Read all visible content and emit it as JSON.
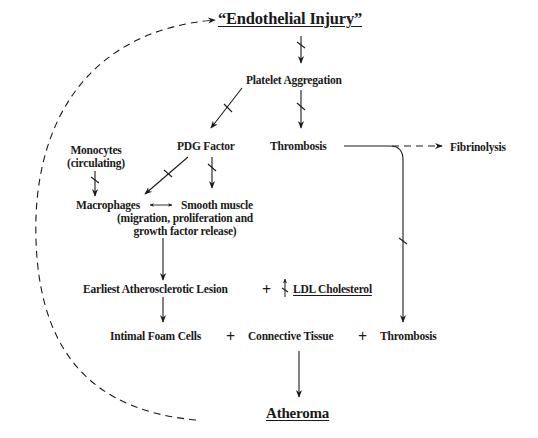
{
  "diagram": {
    "title": "“Endothelial Injury”",
    "nodes": {
      "endothelial_injury": "“Endothelial Injury”",
      "platelet_aggregation": "Platelet Aggregation",
      "pdg_factor": "PDG Factor",
      "thrombosis_top": "Thrombosis",
      "fibrinolysis": "Fibrinolysis",
      "monocytes_line1": "Monocytes",
      "monocytes_line2": "(circulating)",
      "macrophages": "Macrophages",
      "smooth_muscle": "Smooth muscle",
      "smc_detail_line1": "(migration, proliferation and",
      "smc_detail_line2": "growth factor release)",
      "earliest_lesion": "Earliest Atherosclerotic Lesion",
      "ldl_cholesterol": "LDL Cholesterol",
      "ldl_modifier_icon": "increase-arrow-icon",
      "intimal_foam_cells": "Intimal Foam Cells",
      "connective_tissue": "Connective Tissue",
      "thrombosis_bottom": "Thrombosis",
      "atheroma": "Atheroma"
    },
    "operators": {
      "plus1": "+",
      "plus2": "+",
      "plus3": "+"
    },
    "edges": [
      {
        "from": "Endothelial Injury",
        "to": "Platelet Aggregation",
        "style": "solid",
        "inhibited_mark": true
      },
      {
        "from": "Platelet Aggregation",
        "to": "PDG Factor",
        "style": "solid",
        "inhibited_mark": true
      },
      {
        "from": "Platelet Aggregation",
        "to": "Thrombosis",
        "style": "solid",
        "inhibited_mark": true
      },
      {
        "from": "Thrombosis",
        "to": "Fibrinolysis",
        "style": "dashed"
      },
      {
        "from": "Thrombosis",
        "to": "Thrombosis (bottom)",
        "style": "solid",
        "inhibited_mark": true
      },
      {
        "from": "Monocytes",
        "to": "Macrophages",
        "style": "solid",
        "inhibited_mark": true
      },
      {
        "from": "PDG Factor",
        "to": "Macrophages",
        "style": "solid",
        "inhibited_mark": true
      },
      {
        "from": "PDG Factor",
        "to": "Smooth muscle",
        "style": "solid",
        "inhibited_mark": true
      },
      {
        "from": "Macrophages",
        "to": "Smooth muscle",
        "style": "bidirectional"
      },
      {
        "from": "Macrophages/Smooth muscle",
        "to": "Earliest Atherosclerotic Lesion",
        "style": "solid"
      },
      {
        "from": "Earliest Atherosclerotic Lesion",
        "to": "Intimal Foam Cells",
        "style": "solid"
      },
      {
        "from": "Connective Tissue",
        "to": "Atheroma",
        "style": "solid"
      },
      {
        "from": "Atheroma",
        "to": "Endothelial Injury",
        "style": "dashed-loop"
      }
    ]
  }
}
